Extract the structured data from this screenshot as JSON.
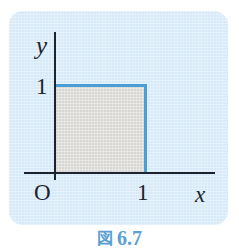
{
  "figure": {
    "caption_kanji": "図",
    "caption_number": "6.7",
    "panel_color": "#d7eaf7",
    "caption_color": "#5b9fd4"
  },
  "chart_data": {
    "type": "area",
    "title": "",
    "subtitle": "",
    "xlabel": "x",
    "ylabel": "y",
    "origin_label": "O",
    "xlim": [
      0,
      1.45
    ],
    "ylim": [
      0,
      1.45
    ],
    "xticks": [
      1
    ],
    "xticklabels": [
      "1"
    ],
    "yticks": [
      1
    ],
    "yticklabels": [
      "1"
    ],
    "grid": false,
    "legend": null,
    "annotations": [],
    "regions": [
      {
        "name": "unit-square",
        "description": "shaded unit square region 0<=x<=1, 0<=y<=1",
        "x": [
          0,
          1,
          1,
          0
        ],
        "y": [
          0,
          0,
          1,
          1
        ],
        "fill_color": "#dedcd8",
        "edge_color": "#4a9ed6",
        "edges_drawn": [
          "top",
          "right"
        ]
      }
    ],
    "series": [
      {
        "name": "y = 1 (top boundary)",
        "type": "line",
        "x": [
          0,
          1
        ],
        "y": [
          1,
          1
        ],
        "color": "#4a9ed6"
      },
      {
        "name": "x = 1 (right boundary)",
        "type": "line",
        "x": [
          1,
          1
        ],
        "y": [
          1,
          0
        ],
        "color": "#4a9ed6"
      }
    ]
  }
}
